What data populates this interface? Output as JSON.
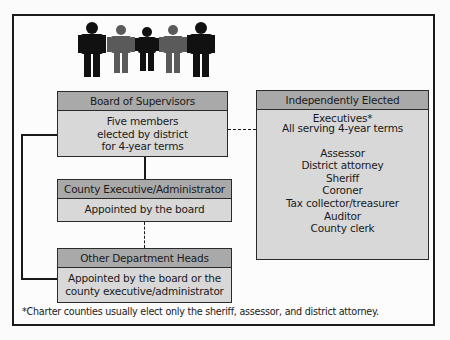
{
  "people_icons": {
    "count": 5,
    "colors": [
      "#111111",
      "#555555",
      "#111111",
      "#555555",
      "#111111"
    ]
  },
  "board": {
    "title": "Board of Supervisors",
    "lines": [
      "Five members",
      "elected by district",
      "for 4-year terms"
    ]
  },
  "county_executive": {
    "title": "County Executive/Administrator",
    "lines": [
      "Appointed by the board"
    ]
  },
  "department_heads": {
    "title": "Other Department Heads",
    "lines": [
      "Appointed by the board or the",
      "county executive/administrator"
    ]
  },
  "independent_executives": {
    "title": "Independently Elected Executives*",
    "subtitle": "All serving 4-year terms",
    "offices": [
      "Assessor",
      "District attorney",
      "Sheriff",
      "Coroner",
      "Tax collector/treasurer",
      "Auditor",
      "County clerk"
    ]
  },
  "footnote": "*Charter counties usually elect only the sheriff, assessor, and district attorney.",
  "colors": {
    "header_fill": "#a9a9a9",
    "body_fill": "#d8d8d8",
    "line": "#1a1a1a"
  }
}
